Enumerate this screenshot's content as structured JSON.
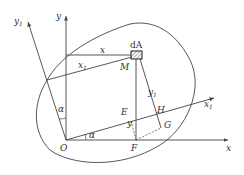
{
  "diagram": {
    "title": "",
    "labels": {
      "y1_axis": "y",
      "y1_axis_sub": "1",
      "y_axis": "y",
      "x_axis": "x",
      "x1_axis": "x",
      "x1_axis_sub": "1",
      "x_seg": "x",
      "x1_seg": "x",
      "x1_seg_sub": "1",
      "dA": "dA",
      "M": "M",
      "y_seg": "y",
      "y1_seg": "y",
      "y1_seg_sub": "1",
      "alpha_top": "α",
      "alpha_bottom": "α",
      "O": "O",
      "E": "E",
      "F": "F",
      "H": "H",
      "G": "G"
    },
    "colors": {
      "line": "#444444",
      "text": "#333333"
    }
  }
}
